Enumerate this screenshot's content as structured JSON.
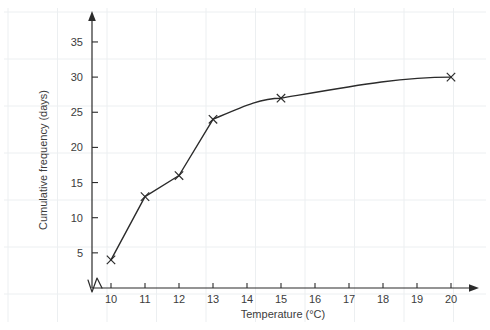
{
  "chart_data": {
    "type": "line",
    "title": "",
    "subtitle": "",
    "xlabel": "Temperature (°C)",
    "ylabel": "Cumulative frequency (days)",
    "xlim": [
      9.4,
      20.8
    ],
    "ylim": [
      0,
      38
    ],
    "xticks": [
      10,
      11,
      12,
      13,
      14,
      15,
      16,
      17,
      18,
      19,
      20
    ],
    "xtick_labels": [
      "10",
      "11",
      "12",
      "13",
      "14",
      "15",
      "16",
      "17",
      "18",
      "19",
      "20"
    ],
    "yticks": [
      5,
      10,
      15,
      20,
      25,
      30,
      35
    ],
    "ytick_labels": [
      "5",
      "10",
      "15",
      "20",
      "25",
      "30",
      "35"
    ],
    "grid": true,
    "grid_color": "#eceff1",
    "legend": null,
    "axis_break_x": true,
    "marker": "x",
    "line_color": "#2b2b2b",
    "series": [
      {
        "name": "Cumulative frequency",
        "x": [
          10,
          11,
          12,
          13,
          15,
          20
        ],
        "values": [
          4,
          13,
          16,
          24,
          27,
          30
        ],
        "points": [
          {
            "x": 10,
            "y": 4
          },
          {
            "x": 11,
            "y": 13
          },
          {
            "x": 12,
            "y": 16
          },
          {
            "x": 13,
            "y": 24
          },
          {
            "x": 15,
            "y": 27
          },
          {
            "x": 20,
            "y": 30
          }
        ]
      }
    ]
  },
  "figure": {
    "background": "#ffffff",
    "text_color": "#3c3c3c"
  }
}
